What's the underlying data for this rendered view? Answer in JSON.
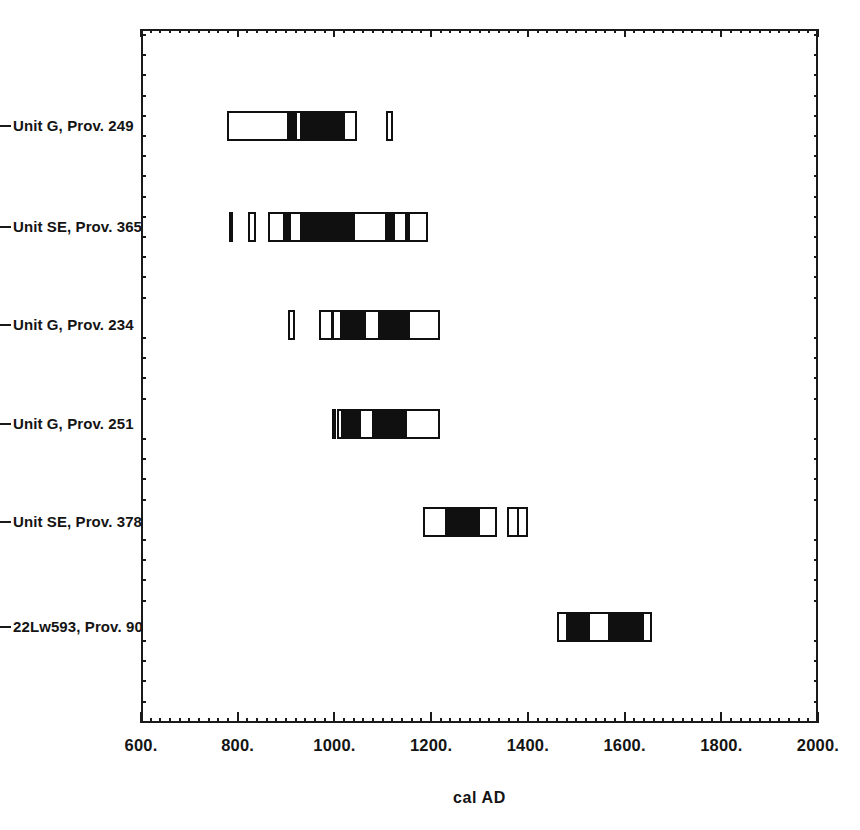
{
  "chart_data": {
    "type": "bar",
    "title": "",
    "xlabel": "cal AD",
    "ylabel": "",
    "xlim": [
      600,
      2000
    ],
    "xtick_labels": [
      "600.",
      "800.",
      "1000.",
      "1200.",
      "1400.",
      "1600.",
      "1800.",
      "2000."
    ],
    "xticks": [
      600,
      800,
      1000,
      1200,
      1400,
      1600,
      1800,
      2000
    ],
    "xminor_step": 20,
    "grid": false,
    "legend": null,
    "orientation": "horizontal",
    "categories": [
      "Unit G, Prov. 249",
      "Unit SE, Prov. 365",
      "Unit G, Prov. 234",
      "Unit G, Prov. 251",
      "Unit SE, Prov. 378",
      "22Lw593, Prov. 90"
    ],
    "series": [
      {
        "name": "Unit G, Prov. 249",
        "ranges": [
          {
            "start": 778,
            "end": 1047,
            "fills": [
              [
                902,
                922
              ],
              [
                929,
                1022
              ]
            ]
          },
          {
            "start": 1107,
            "end": 1122,
            "fills": []
          }
        ]
      },
      {
        "name": "Unit SE, Prov. 365",
        "ranges": [
          {
            "start": 782,
            "end": 788,
            "fills": [
              [
                782,
                788
              ]
            ]
          },
          {
            "start": 822,
            "end": 837,
            "fills": []
          },
          {
            "start": 862,
            "end": 1193,
            "fills": [
              [
                893,
                911
              ],
              [
                928,
                1042
              ],
              [
                1105,
                1126
              ],
              [
                1146,
                1156
              ]
            ]
          }
        ]
      },
      {
        "name": "Unit G, Prov. 234",
        "ranges": [
          {
            "start": 904,
            "end": 919,
            "fills": []
          },
          {
            "start": 968,
            "end": 1218,
            "fills": [
              [
                993,
                999
              ],
              [
                1011,
                1065
              ],
              [
                1090,
                1156
              ]
            ]
          }
        ]
      },
      {
        "name": "Unit G, Prov. 251",
        "ranges": [
          {
            "start": 995,
            "end": 1001,
            "fills": [
              [
                995,
                1001
              ]
            ]
          },
          {
            "start": 1005,
            "end": 1218,
            "fills": [
              [
                1013,
                1054
              ],
              [
                1077,
                1150
              ]
            ]
          }
        ]
      },
      {
        "name": "Unit SE, Prov. 378",
        "ranges": [
          {
            "start": 1183,
            "end": 1336,
            "fills": [
              [
                1229,
                1301
              ]
            ]
          },
          {
            "start": 1357,
            "end": 1400,
            "fills": [
              [
                1377,
                1381
              ]
            ]
          }
        ]
      },
      {
        "name": "22Lw593, Prov. 90",
        "ranges": [
          {
            "start": 1460,
            "end": 1657,
            "fills": [
              [
                1479,
                1528
              ],
              [
                1566,
                1641
              ]
            ]
          }
        ]
      }
    ]
  },
  "axis": {
    "x_title": "cal AD"
  }
}
